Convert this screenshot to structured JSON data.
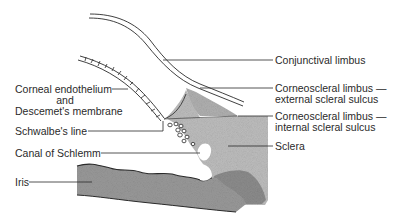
{
  "diagram": {
    "colors": {
      "ink": "#2a2a2a",
      "tissue_light": "#b8b8b8",
      "tissue_dark": "#8a8a8a",
      "background": "#ffffff"
    },
    "labels_left": [
      {
        "id": "corneal-endothelium",
        "lines": [
          "Corneal endothelium",
          "and",
          "Descemet's membrane"
        ]
      },
      {
        "id": "schwalbes-line",
        "text": "Schwalbe's line"
      },
      {
        "id": "canal-of-schlemm",
        "text": "Canal of Schlemm"
      },
      {
        "id": "iris",
        "text": "Iris"
      }
    ],
    "labels_right": [
      {
        "id": "conjunctival-limbus",
        "text": "Conjunctival limbus"
      },
      {
        "id": "corneoscleral-external",
        "lines": [
          "Corneoscleral limbus —",
          "external scleral sulcus"
        ]
      },
      {
        "id": "corneoscleral-internal",
        "lines": [
          "Corneoscleral limbus —",
          "internal scleral sulcus"
        ]
      },
      {
        "id": "sclera",
        "text": "Sclera"
      }
    ]
  }
}
